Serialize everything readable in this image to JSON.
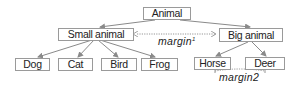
{
  "diagram": {
    "type": "tree",
    "root": {
      "label": "Animal",
      "children": [
        {
          "label": "Small animal",
          "children": [
            {
              "label": "Dog"
            },
            {
              "label": "Cat"
            },
            {
              "label": "Bird"
            },
            {
              "label": "Frog"
            }
          ]
        },
        {
          "label": "Big animal",
          "children": [
            {
              "label": "Horse"
            },
            {
              "label": "Deer"
            }
          ]
        }
      ]
    },
    "nodes": {
      "animal": "Animal",
      "small_animal": "Small animal",
      "big_animal": "Big animal",
      "dog": "Dog",
      "cat": "Cat",
      "bird": "Bird",
      "frog": "Frog",
      "horse": "Horse",
      "deer": "Deer"
    },
    "annotations": {
      "margin1_base": "margin",
      "margin1_sup": "1",
      "margin2": "margin2"
    },
    "colors": {
      "edge": "#8a8a8a",
      "border": "#9a9a9a",
      "text": "#222222"
    }
  }
}
